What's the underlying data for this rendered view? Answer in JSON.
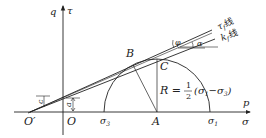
{
  "diagram": {
    "type": "mohr_circle_strength_envelope",
    "axes": {
      "vertical_label_left": "q",
      "vertical_label_right": "τ",
      "horizontal_label_top": "p",
      "horizontal_label_bottom": "σ"
    },
    "points": {
      "o_prime": "O′",
      "o": "O",
      "a": "A",
      "b": "B",
      "c": "C",
      "sigma3": "σ",
      "sigma3_sub": "3",
      "sigma1": "σ",
      "sigma1_sub": "1"
    },
    "lines": {
      "tau_f_line": "τ",
      "tau_f_sub": "f",
      "tau_f_suffix": "线",
      "k_f_line": "k",
      "k_f_sub": "f",
      "k_f_suffix": "线"
    },
    "angles": {
      "phi": "φ",
      "alpha": "α"
    },
    "intercepts": {
      "c": "c",
      "a": "a"
    },
    "formula": {
      "lhs": "R =",
      "num": "1",
      "den": "2",
      "rhs_open": "(σ",
      "s1_sub": "1",
      "minus": "−σ",
      "s3_sub": "3",
      "rhs_close": ")"
    }
  }
}
